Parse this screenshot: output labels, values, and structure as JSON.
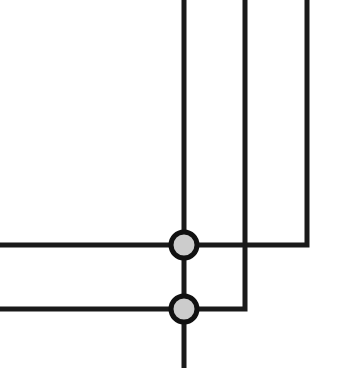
{
  "diagram": {
    "type": "wire-crossing-junction-diagram",
    "width": 347,
    "height": 368,
    "colors": {
      "background": "#ffffff",
      "wire": "#1a1a1a",
      "junction_fill": "#cccccc",
      "junction_stroke": "#111111"
    },
    "wire_width": 5,
    "wires": [
      {
        "id": "wire-a",
        "points": [
          [
            184,
            0
          ],
          [
            184,
            368
          ]
        ]
      },
      {
        "id": "wire-b",
        "points": [
          [
            245,
            0
          ],
          [
            245,
            309
          ],
          [
            0,
            309
          ]
        ]
      },
      {
        "id": "wire-c",
        "points": [
          [
            307,
            0
          ],
          [
            307,
            245
          ],
          [
            0,
            245
          ]
        ]
      }
    ],
    "junctions": [
      {
        "id": "junction-upper",
        "cx": 184,
        "cy": 245,
        "r": 13
      },
      {
        "id": "junction-lower",
        "cx": 184,
        "cy": 309,
        "r": 13
      }
    ],
    "crossings_without_junction": [
      {
        "cx": 245,
        "cy": 245
      }
    ]
  }
}
